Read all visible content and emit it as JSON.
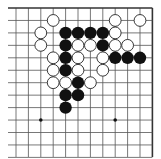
{
  "board": {
    "description": "Go board diagram, top-right corner region",
    "columns": 12,
    "rows": 13,
    "origin_x": 16,
    "origin_y": 8,
    "spacing_x": 12.4,
    "spacing_y": 12.45,
    "line_color": "#555555",
    "border_color": "#333333",
    "edges": {
      "top": true,
      "right": true,
      "left": false,
      "bottom": false
    },
    "star_points": [
      [
        2,
        9
      ],
      [
        8,
        9
      ]
    ]
  },
  "stones": {
    "white": [
      [
        3,
        1
      ],
      [
        8,
        1
      ],
      [
        10,
        1
      ],
      [
        2,
        2
      ],
      [
        8,
        2
      ],
      [
        2,
        3
      ],
      [
        5,
        3
      ],
      [
        6,
        3
      ],
      [
        8,
        3
      ],
      [
        9,
        3
      ],
      [
        3,
        4
      ],
      [
        5,
        4
      ],
      [
        7,
        4
      ],
      [
        3,
        5
      ],
      [
        5,
        5
      ],
      [
        7,
        5
      ],
      [
        3,
        6
      ],
      [
        4,
        6
      ],
      [
        6,
        6
      ]
    ],
    "black": [
      [
        4,
        2
      ],
      [
        5,
        2
      ],
      [
        6,
        2
      ],
      [
        7,
        2
      ],
      [
        4,
        3
      ],
      [
        7,
        3
      ],
      [
        4,
        4
      ],
      [
        8,
        4
      ],
      [
        9,
        4
      ],
      [
        10,
        4
      ],
      [
        4,
        5
      ],
      [
        5,
        6
      ],
      [
        4,
        7
      ],
      [
        5,
        7
      ],
      [
        4,
        8
      ]
    ],
    "white_fill": "#ffffff",
    "white_stroke": "#222222",
    "black_fill": "#111111"
  }
}
